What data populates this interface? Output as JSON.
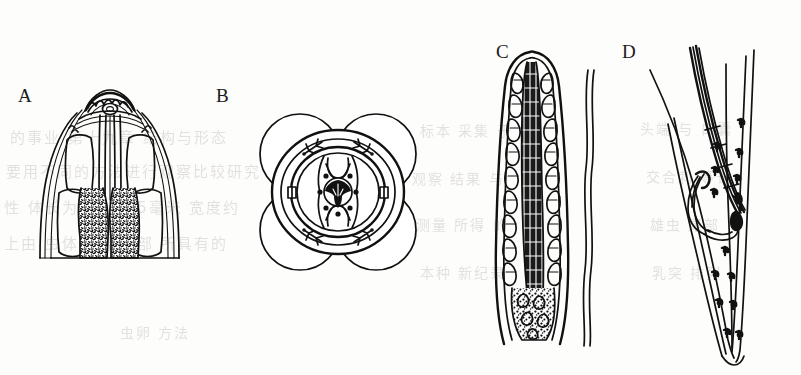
{
  "figure": {
    "kind": "scientific-line-drawing-plate",
    "background_color": "#fdfdfc",
    "ink_color": "#111111",
    "width": 801,
    "height": 375
  },
  "panels": [
    {
      "label": "A",
      "label_x": 18,
      "label_y": 86,
      "name": "anterior-end-lateral-view",
      "description": "Anterior end, bell-shaped head with scalloped apical cap, paired lateral cell compartments, central oesophageal tube and two stippled glandular lobes",
      "features": [
        "scalloped apical cap",
        "oral opening",
        "cephalic collar rings",
        "lateral alae",
        "paired anterior cells",
        "central oesophagus",
        "stippled glandular lobes"
      ]
    },
    {
      "label": "B",
      "label_x": 216,
      "label_y": 86,
      "name": "en-face-view",
      "description": "En face view: four large outer lobes, concentric cephalic rings, six inner papillae dots, lateral amphids and a dark trifoliate mouth opening at centre",
      "features": [
        "four outer lobes",
        "outer cephalic ring",
        "inner cephalic ring",
        "four trident papillae",
        "two lateral amphids",
        "six submedian dot papillae",
        "trifoliate oral aperture"
      ]
    },
    {
      "label": "C",
      "label_x": 496,
      "label_y": 42,
      "name": "tail-tip-detail",
      "description": "Tapered terminal portion with rounded apex, dark striated central canal, vacuolated cellular wall texture and granular mass at base; body-wall line at right",
      "features": [
        "rounded apex",
        "dark striated central canal",
        "vacuolated cell rows",
        "granular basal mass",
        "body wall line"
      ]
    },
    {
      "label": "D",
      "label_x": 622,
      "label_y": 42,
      "name": "male-posterior-end",
      "description": "Male posterior end showing spicule and gubernaculum complex, caudal papillae arranged along the body, and tapering tail with cuticular lines",
      "features": [
        "spicule",
        "gubernaculum",
        "caudal papillae",
        "cloacal opening",
        "tapering tail",
        "cuticular striae"
      ]
    }
  ],
  "bleed_text": {
    "note": "faint show-through characters from the reverse side of the printed page",
    "lines": [
      {
        "text": "的事业 第十九章 结构与形态",
        "x": 10,
        "y": 126,
        "size": 15
      },
      {
        "text": "要用不同的方法进行观察比较研究",
        "x": 6,
        "y": 160,
        "size": 15
      },
      {
        "text": "性 体长为 12—15毫米 宽度约",
        "x": 4,
        "y": 196,
        "size": 15
      },
      {
        "text": "上由 虫体后端 尾部 所具有的",
        "x": 4,
        "y": 232,
        "size": 15
      },
      {
        "text": "虫卵 方法",
        "x": 120,
        "y": 322,
        "size": 14
      },
      {
        "text": "标本 采集 于",
        "x": 420,
        "y": 120,
        "size": 14
      },
      {
        "text": "观察 结果 与",
        "x": 412,
        "y": 168,
        "size": 14
      },
      {
        "text": "测量 所得 的",
        "x": 416,
        "y": 214,
        "size": 14
      },
      {
        "text": "本种 新纪录",
        "x": 420,
        "y": 262,
        "size": 14
      },
      {
        "text": "头端 与 口囊",
        "x": 640,
        "y": 118,
        "size": 14
      },
      {
        "text": "交合刺 等长",
        "x": 646,
        "y": 166,
        "size": 14
      },
      {
        "text": "雄虫 尾部",
        "x": 650,
        "y": 214,
        "size": 14
      },
      {
        "text": "乳突 排列",
        "x": 652,
        "y": 262,
        "size": 14
      }
    ]
  }
}
